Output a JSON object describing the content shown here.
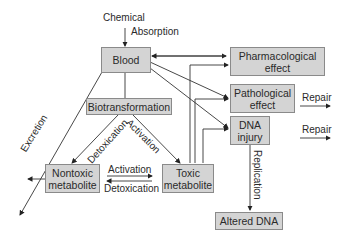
{
  "diagram": {
    "title_input": "Chemical",
    "nodes": {
      "blood": "Blood",
      "biotransformation": "Biotransformation",
      "nontoxic": "Nontoxic\nmetabolite",
      "toxic": "Toxic\nmetabolite",
      "pharmacological": "Pharmacological\neffect",
      "pathological": "Pathological\neffect",
      "dna_injury": "DNA\ninjury",
      "altered_dna": "Altered DNA"
    },
    "edge_labels": {
      "absorption": "Absorption",
      "excretion": "Excretion",
      "detox_left": "Detoxication",
      "activation_right": "Activation",
      "activation_mid": "Activation",
      "detox_mid": "Detoxication",
      "replication": "Replication",
      "repair1": "Repair",
      "repair2": "Repair"
    }
  }
}
